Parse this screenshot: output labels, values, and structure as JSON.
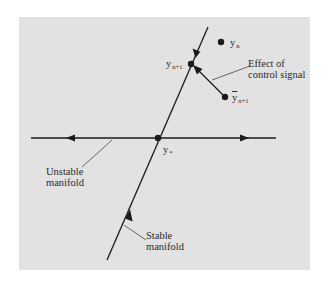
{
  "diagram": {
    "colors": {
      "background": "#ffffff",
      "panel": "#e2e2e2",
      "ink": "#1a1a1a",
      "label": "#2a2a2a"
    },
    "points": {
      "yn_top": {
        "base": "y",
        "sub": "n"
      },
      "yn1": {
        "base": "y",
        "sub": "n+1"
      },
      "ybar_n1": {
        "base": "y",
        "sub": "n+1",
        "overbar": true
      },
      "yn_fixed": {
        "base": "y",
        "sub": "*"
      }
    },
    "annotations": {
      "control_line1": "Effect of",
      "control_line2": "control signal",
      "unstable_line1": "Unstable",
      "unstable_line2": "manifold",
      "stable_line1": "Stable",
      "stable_line2": "manifold"
    }
  }
}
